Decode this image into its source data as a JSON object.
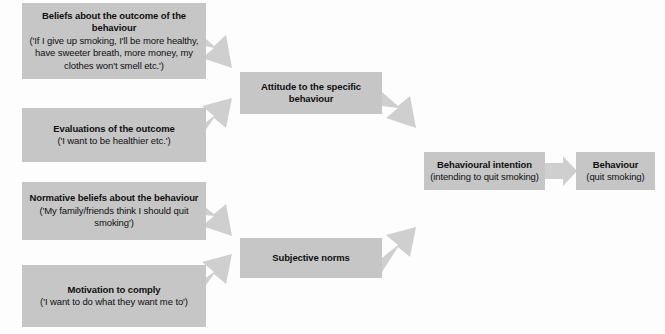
{
  "figure": {
    "name": "theory-of-planned-behaviour",
    "background_color": "#fdfdfd",
    "box_fill_color": "#c6c6c6",
    "arrow_fill_color": "#cfcfcf",
    "text_color": "#101010"
  },
  "nodes": [
    {
      "id": "beliefs-about-outcome",
      "title": "Beliefs about the outcome of the behaviour",
      "subtitle": "('If I give up smoking, I'll be more healthy, have sweeter breath, more money, my clothes won't smell etc.')"
    },
    {
      "id": "evaluations-of-outcome",
      "title": "Evaluations of the outcome",
      "subtitle": "('I want to be healthier etc.')"
    },
    {
      "id": "normative-beliefs",
      "title": "Normative beliefs about the behaviour",
      "subtitle": "('My family/friends think I should quit smoking')"
    },
    {
      "id": "motivation-to-comply",
      "title": "Motivation to comply",
      "subtitle": "('I want to do what they want me to')"
    },
    {
      "id": "attitude-to-behaviour",
      "title": "Attitude to the specific behaviour",
      "subtitle": ""
    },
    {
      "id": "subjective-norms",
      "title": "Subjective norms",
      "subtitle": ""
    },
    {
      "id": "behavioural-intention",
      "title": "Behavioural intention",
      "subtitle": "(intending to quit smoking)"
    },
    {
      "id": "behaviour",
      "title": "Behaviour",
      "subtitle": "(quit smoking)"
    }
  ],
  "arrows": [
    {
      "id": "beliefs-to-attitude",
      "from": "beliefs-about-outcome",
      "to": "attitude-to-behaviour",
      "direction": "down-right"
    },
    {
      "id": "evaluations-to-attitude",
      "from": "evaluations-of-outcome",
      "to": "attitude-to-behaviour",
      "direction": "up-right"
    },
    {
      "id": "normative-to-subjective",
      "from": "normative-beliefs",
      "to": "subjective-norms",
      "direction": "down-right"
    },
    {
      "id": "motivation-to-subjective",
      "from": "motivation-to-comply",
      "to": "subjective-norms",
      "direction": "up-right"
    },
    {
      "id": "attitude-to-intention",
      "from": "attitude-to-behaviour",
      "to": "behavioural-intention",
      "direction": "down-right"
    },
    {
      "id": "subjective-to-intention",
      "from": "subjective-norms",
      "to": "behavioural-intention",
      "direction": "up-right"
    },
    {
      "id": "intention-to-behaviour",
      "from": "behavioural-intention",
      "to": "behaviour",
      "direction": "right"
    }
  ]
}
